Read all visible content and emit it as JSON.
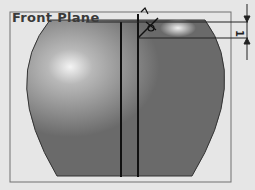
{
  "viewport": {
    "plane_label": "Front Plane",
    "dimension_value": "1",
    "colors": {
      "background": "#e6e6e6",
      "plane_border": "#6a6a6a",
      "body_fill": "#6e6e6e",
      "body_highlight": "#f2f2f2",
      "sketch_line": "#1a1a1a"
    }
  }
}
